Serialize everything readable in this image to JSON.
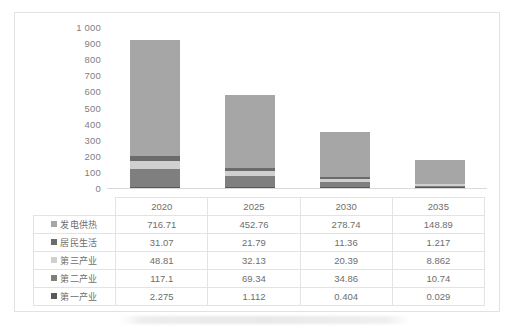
{
  "chart_data": {
    "type": "bar",
    "subtype": "stacked-column",
    "title": "",
    "xlabel": "",
    "ylabel": "",
    "categories": [
      "2020",
      "2025",
      "2030",
      "2035"
    ],
    "ylim": [
      0,
      1000
    ],
    "y_ticks": [
      "1 000",
      "900",
      "800",
      "700",
      "600",
      "500",
      "400",
      "300",
      "200",
      "100",
      "0"
    ],
    "y_tick_values": [
      1000,
      900,
      800,
      700,
      600,
      500,
      400,
      300,
      200,
      100,
      0
    ],
    "grid": false,
    "legend_position": "table-left",
    "stack_order_bottom_to_top": [
      "第一产业",
      "第二产业",
      "第三产业",
      "居民生活",
      "发电供热"
    ],
    "series": [
      {
        "name": "发电供热",
        "color": "#a6a6a6",
        "values": [
          716.71,
          452.76,
          278.74,
          148.89
        ],
        "labels": [
          "716.71",
          "452.76",
          "278.74",
          "148.89"
        ]
      },
      {
        "name": "居民生活",
        "color": "#6b6b6b",
        "values": [
          31.07,
          21.79,
          11.36,
          1.217
        ],
        "labels": [
          "31.07",
          "21.79",
          "11.36",
          "1.217"
        ]
      },
      {
        "name": "第三产业",
        "color": "#d0d0d0",
        "values": [
          48.81,
          32.13,
          20.39,
          8.862
        ],
        "labels": [
          "48.81",
          "32.13",
          "20.39",
          "8.862"
        ]
      },
      {
        "name": "第二产业",
        "color": "#7f7f7f",
        "values": [
          117.1,
          69.34,
          34.86,
          10.74
        ],
        "labels": [
          "117.1",
          "69.34",
          "34.86",
          "10.74"
        ]
      },
      {
        "name": "第一产业",
        "color": "#595959",
        "values": [
          2.275,
          1.112,
          0.404,
          0.029
        ],
        "labels": [
          "2.275",
          "1.112",
          "0.404",
          "0.029"
        ]
      }
    ],
    "totals": [
      915.965,
      577.132,
      345.754,
      169.738
    ]
  },
  "table": {
    "corner_label": "",
    "year_headers": [
      "2020",
      "2025",
      "2030",
      "2035"
    ],
    "rows": [
      {
        "legend": "发电供热",
        "color": "#a6a6a6",
        "values": [
          "716.71",
          "452.76",
          "278.74",
          "148.89"
        ]
      },
      {
        "legend": "居民生活",
        "color": "#6b6b6b",
        "values": [
          "31.07",
          "21.79",
          "11.36",
          "1.217"
        ]
      },
      {
        "legend": "第三产业",
        "color": "#d0d0d0",
        "values": [
          "48.81",
          "32.13",
          "20.39",
          "8.862"
        ]
      },
      {
        "legend": "第二产业",
        "color": "#7f7f7f",
        "values": [
          "117.1",
          "69.34",
          "34.86",
          "10.74"
        ]
      },
      {
        "legend": "第一产业",
        "color": "#595959",
        "values": [
          "2.275",
          "1.112",
          "0.404",
          "0.029"
        ]
      }
    ]
  },
  "colors": {
    "frame_border": "#e2e2e2",
    "table_border": "#e3e3e3",
    "axis_line": "#d9d9d9",
    "text": "#6e6e6e"
  }
}
